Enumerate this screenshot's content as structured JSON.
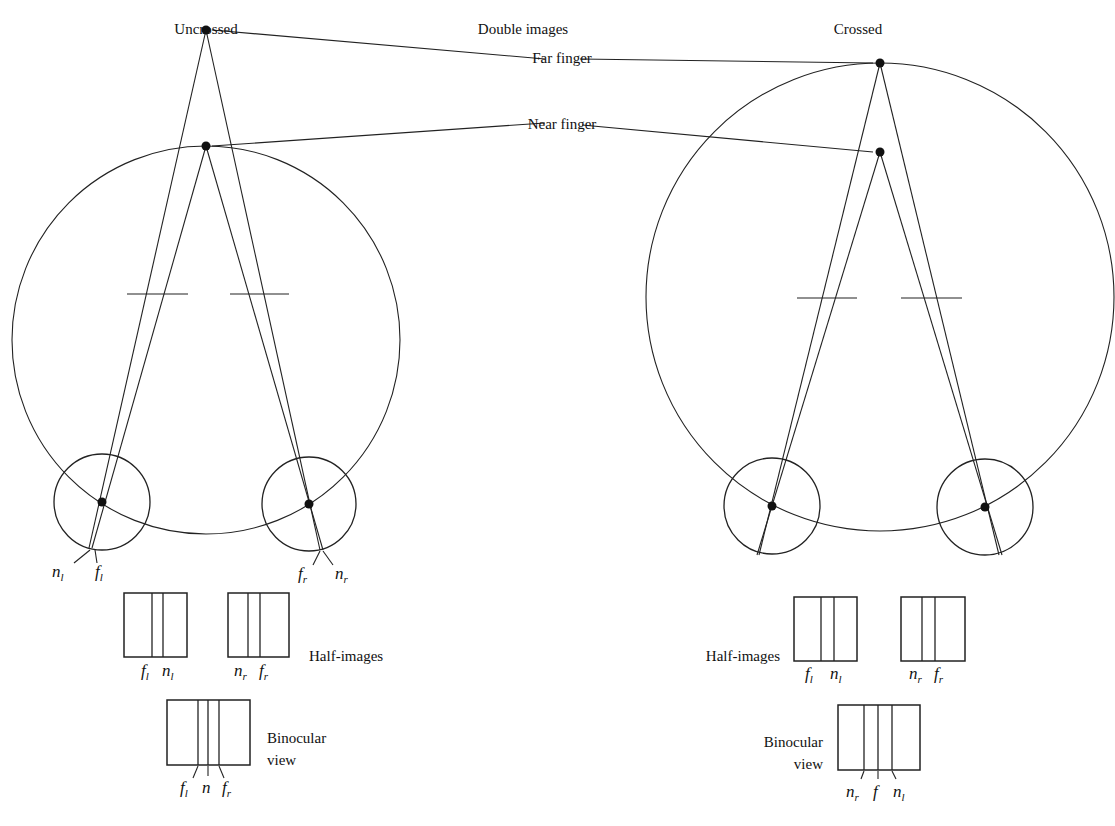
{
  "title": {
    "left": "Uncrossed",
    "center": "Double images",
    "right": "Crossed"
  },
  "callouts": {
    "far_finger": "Far finger",
    "near_finger": "Near finger"
  },
  "uncrossed": {
    "eye_labels": {
      "left_near": {
        "base": "n",
        "sub": "l"
      },
      "left_far": {
        "base": "f",
        "sub": "l"
      },
      "right_far": {
        "base": "f",
        "sub": "r"
      },
      "right_near": {
        "base": "n",
        "sub": "r"
      }
    },
    "half_images_label": "Half-images",
    "half_image_left": [
      {
        "base": "f",
        "sub": "l"
      },
      {
        "base": "n",
        "sub": "l"
      }
    ],
    "half_image_right": [
      {
        "base": "n",
        "sub": "r"
      },
      {
        "base": "f",
        "sub": "r"
      }
    ],
    "binocular_label_line1": "Binocular",
    "binocular_label_line2": "view",
    "binocular_marks": [
      {
        "base": "f",
        "sub": "l"
      },
      {
        "base": "n",
        "sub": ""
      },
      {
        "base": "f",
        "sub": "r"
      }
    ]
  },
  "crossed": {
    "half_images_label": "Half-images",
    "half_image_left": [
      {
        "base": "f",
        "sub": "l"
      },
      {
        "base": "n",
        "sub": "l"
      }
    ],
    "half_image_right": [
      {
        "base": "n",
        "sub": "r"
      },
      {
        "base": "f",
        "sub": "r"
      }
    ],
    "binocular_label_line1": "Binocular",
    "binocular_label_line2": "view",
    "binocular_marks": [
      {
        "base": "n",
        "sub": "r"
      },
      {
        "base": "f",
        "sub": ""
      },
      {
        "base": "n",
        "sub": "l"
      }
    ]
  },
  "colors": {
    "line": "#222222",
    "background": "#ffffff"
  }
}
